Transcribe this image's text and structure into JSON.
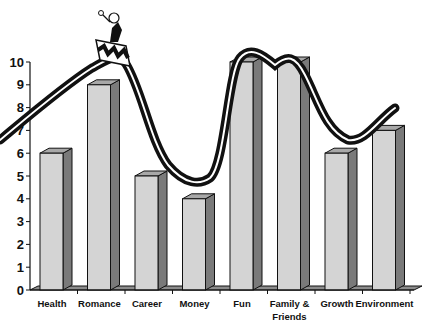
{
  "chart_data": {
    "type": "bar",
    "title": "",
    "xlabel": "",
    "ylabel": "",
    "ylim": [
      0,
      10
    ],
    "yticks": [
      0,
      1,
      2,
      3,
      4,
      5,
      6,
      7,
      8,
      9,
      10
    ],
    "grid": false,
    "legend": null,
    "categories": [
      "Health",
      "Romance",
      "Career",
      "Money",
      "Fun",
      "Family & Friends",
      "Growth",
      "Environment"
    ],
    "category_label_lines": [
      [
        "Health"
      ],
      [
        "Romance"
      ],
      [
        "Career"
      ],
      [
        "Money"
      ],
      [
        "Fun"
      ],
      [
        "Family &",
        "Friends"
      ],
      [
        "Growth"
      ],
      [
        "Environment"
      ]
    ],
    "values": [
      6,
      9,
      5,
      4,
      10,
      10,
      6,
      7
    ],
    "style": "3d-bar",
    "colors": {
      "bar_face": "#d4d4d4",
      "bar_side": "#7a7a7a",
      "bar_top": "#a8a8a8",
      "floor": "#8c8c8c",
      "axis": "#111111",
      "curve": "#111111"
    },
    "annotations": [
      {
        "type": "roller-coaster-curve",
        "description": "Double-line wavy track over the bars, resembling a roller coaster"
      },
      {
        "type": "illustration",
        "description": "Cartoon figure riding a roller coaster car at the crest above Romance"
      }
    ]
  }
}
